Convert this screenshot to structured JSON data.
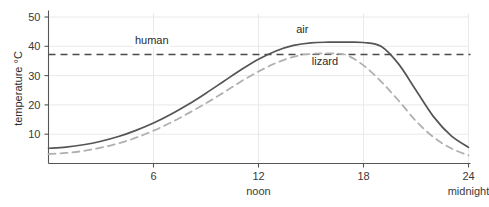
{
  "chart_data": {
    "type": "line",
    "title": "",
    "xlabel": "",
    "ylabel": "temperature °C",
    "xlim": [
      0,
      24
    ],
    "ylim": [
      0,
      53
    ],
    "grid": true,
    "legend": "inline-annotations",
    "x_ticks": [
      {
        "value": 6,
        "label": "6",
        "sublabel": ""
      },
      {
        "value": 12,
        "label": "12",
        "sublabel": "noon"
      },
      {
        "value": 18,
        "label": "18",
        "sublabel": ""
      },
      {
        "value": 24,
        "label": "24",
        "sublabel": "midnight"
      }
    ],
    "y_ticks": [
      {
        "value": 10,
        "label": "10"
      },
      {
        "value": 20,
        "label": "20"
      },
      {
        "value": 30,
        "label": "30"
      },
      {
        "value": 40,
        "label": "40"
      },
      {
        "value": 50,
        "label": "50"
      }
    ],
    "x": [
      0,
      1,
      2,
      3,
      4,
      5,
      6,
      7,
      8,
      9,
      10,
      11,
      12,
      13,
      14,
      15,
      16,
      17,
      18,
      19,
      20,
      21,
      22,
      23,
      24
    ],
    "series": [
      {
        "name": "air",
        "style": "solid",
        "color": "#555555",
        "label": "air",
        "label_x": 14.5,
        "label_y": 44.5,
        "values": [
          5.2,
          5.6,
          6.4,
          7.6,
          9.2,
          11.3,
          13.8,
          16.8,
          20.2,
          24.0,
          28.0,
          32.0,
          35.6,
          38.4,
          40.3,
          41.2,
          41.4,
          41.4,
          41.3,
          40.0,
          34.0,
          25.0,
          16.0,
          9.5,
          5.5
        ]
      },
      {
        "name": "lizard",
        "style": "dashed",
        "color": "#b0b0b0",
        "label": "lizard",
        "label_x": 15.8,
        "label_y": 33.5,
        "values": [
          3.2,
          3.6,
          4.3,
          5.4,
          6.9,
          8.8,
          11.2,
          14.0,
          17.2,
          20.6,
          24.2,
          28.0,
          31.4,
          34.3,
          36.4,
          37.4,
          37.6,
          37.0,
          33.5,
          28.0,
          21.5,
          14.5,
          9.0,
          5.2,
          2.8
        ]
      }
    ],
    "reference_lines": [
      {
        "name": "human",
        "label": "human",
        "value": 37.2,
        "style": "dashed",
        "color": "#4a4a4a",
        "label_x": 5.9,
        "label_y": 40.8
      }
    ]
  }
}
